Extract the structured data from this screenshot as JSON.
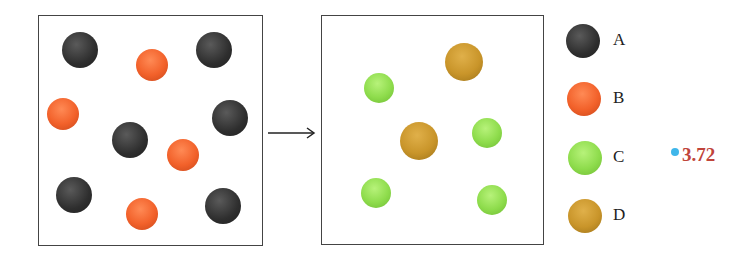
{
  "diagram": {
    "left_box": {
      "balls": [
        {
          "type": "A",
          "x": 80,
          "y": 50,
          "r": 18
        },
        {
          "type": "B",
          "x": 152,
          "y": 65,
          "r": 16
        },
        {
          "type": "A",
          "x": 214,
          "y": 50,
          "r": 18
        },
        {
          "type": "B",
          "x": 63,
          "y": 114,
          "r": 16
        },
        {
          "type": "A",
          "x": 130,
          "y": 140,
          "r": 18
        },
        {
          "type": "B",
          "x": 183,
          "y": 155,
          "r": 16
        },
        {
          "type": "A",
          "x": 230,
          "y": 118,
          "r": 18
        },
        {
          "type": "A",
          "x": 74,
          "y": 195,
          "r": 18
        },
        {
          "type": "B",
          "x": 142,
          "y": 214,
          "r": 16
        },
        {
          "type": "A",
          "x": 223,
          "y": 206,
          "r": 18
        }
      ]
    },
    "arrow": "right-arrow",
    "right_box": {
      "balls": [
        {
          "type": "D",
          "x": 464,
          "y": 62,
          "r": 19
        },
        {
          "type": "C",
          "x": 379,
          "y": 88,
          "r": 15
        },
        {
          "type": "D",
          "x": 419,
          "y": 141,
          "r": 19
        },
        {
          "type": "C",
          "x": 487,
          "y": 133,
          "r": 15
        },
        {
          "type": "C",
          "x": 376,
          "y": 193,
          "r": 15
        },
        {
          "type": "C",
          "x": 492,
          "y": 200,
          "r": 15
        }
      ]
    },
    "legend": [
      {
        "type": "A",
        "label": "A",
        "x": 583,
        "y": 41
      },
      {
        "type": "B",
        "label": "B",
        "x": 584,
        "y": 99
      },
      {
        "type": "C",
        "label": "C",
        "x": 585,
        "y": 158
      },
      {
        "type": "D",
        "label": "D",
        "x": 585,
        "y": 216
      }
    ],
    "annotation": "3.72",
    "colors": {
      "A": "#2e2e2e",
      "B": "#f2612a",
      "C": "#8edc4c",
      "D": "#c9952a",
      "annotation": "#c0443a",
      "dot": "#3fb6ea"
    }
  }
}
